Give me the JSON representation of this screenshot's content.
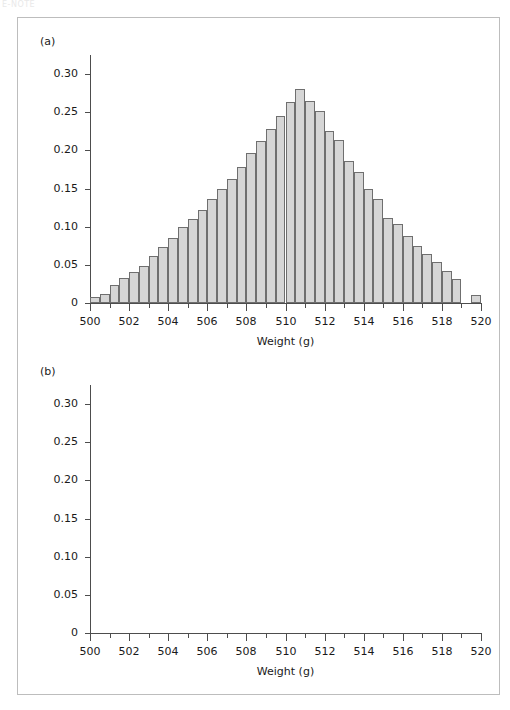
{
  "page_header": "E-NOTE",
  "figure": {
    "panels": [
      {
        "label": "(a)",
        "xlabel": "Weight (g)",
        "ytick_labels": [
          "0.30",
          "0.25",
          "0.20",
          "0.15",
          "0.10",
          "0.05",
          "0"
        ],
        "xtick_labels": [
          "500",
          "502",
          "504",
          "506",
          "508",
          "510",
          "512",
          "514",
          "516",
          "518",
          "520"
        ]
      },
      {
        "label": "(b)",
        "xlabel": "Weight (g)",
        "ytick_labels": [
          "0.30",
          "0.25",
          "0.20",
          "0.15",
          "0.10",
          "0.05",
          "0"
        ],
        "xtick_labels": [
          "500",
          "502",
          "504",
          "506",
          "508",
          "510",
          "512",
          "514",
          "516",
          "518",
          "520"
        ]
      }
    ]
  },
  "colors": {
    "bar_fill": "#d6d6d6",
    "bar_edge": "#6f6f6f",
    "axis": "#4d4d4d",
    "frame_border": "#bdbdbd",
    "text": "#1a1a1a"
  },
  "chart_data": [
    {
      "type": "bar",
      "title": "(a)",
      "xlabel": "Weight (g)",
      "ylabel": "",
      "xlim": [
        500,
        520
      ],
      "ylim": [
        0,
        0.325
      ],
      "ytick_values": [
        0,
        0.05,
        0.1,
        0.15,
        0.2,
        0.25,
        0.3
      ],
      "xtick_values": [
        500,
        502,
        504,
        506,
        508,
        510,
        512,
        514,
        516,
        518,
        520
      ],
      "xtick_minor_step": 1,
      "grid": false,
      "legend": null,
      "bin_width": 2,
      "bin_edges": [
        503,
        505,
        507,
        509,
        511,
        513,
        515,
        517
      ],
      "bin_centers": [
        504,
        506,
        508,
        510,
        512,
        514,
        516
      ],
      "values": [
        0.023,
        0.125,
        0.222,
        0.296,
        0.234,
        0.108,
        0.022
      ]
    },
    {
      "type": "bar",
      "title": "(b)",
      "xlabel": "Weight (g)",
      "ylabel": "",
      "xlim": [
        500,
        520
      ],
      "ylim": [
        0,
        0.325
      ],
      "ytick_values": [
        0,
        0.05,
        0.1,
        0.15,
        0.2,
        0.25,
        0.3
      ],
      "xtick_values": [
        500,
        502,
        504,
        506,
        508,
        510,
        512,
        514,
        516,
        518,
        520
      ],
      "xtick_minor_step": 1,
      "grid": false,
      "legend": null,
      "bin_width": 0.5,
      "bin_starts": [
        500.0,
        500.5,
        501.0,
        501.5,
        502.0,
        502.5,
        503.0,
        503.5,
        504.0,
        504.5,
        505.0,
        505.5,
        506.0,
        506.5,
        507.0,
        507.5,
        508.0,
        508.5,
        509.0,
        509.5,
        510.0,
        510.5,
        511.0,
        511.5,
        512.0,
        512.5,
        513.0,
        513.5,
        514.0,
        514.5,
        515.0,
        515.5,
        516.0,
        516.5,
        517.0,
        517.5,
        518.0,
        518.5,
        519.0,
        519.5
      ],
      "values": [
        0.008,
        0.012,
        0.024,
        0.033,
        0.04,
        0.049,
        0.061,
        0.073,
        0.085,
        0.1,
        0.11,
        0.122,
        0.136,
        0.15,
        0.162,
        0.178,
        0.196,
        0.212,
        0.228,
        0.245,
        0.263,
        0.28,
        0.265,
        0.252,
        0.225,
        0.213,
        0.186,
        0.172,
        0.15,
        0.136,
        0.112,
        0.104,
        0.088,
        0.075,
        0.064,
        0.054,
        0.042,
        0.032,
        0.0,
        0.01
      ]
    }
  ]
}
